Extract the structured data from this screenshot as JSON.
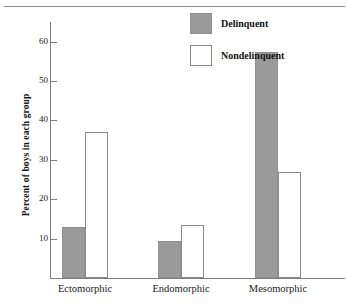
{
  "chart_data": {
    "type": "bar",
    "title": "",
    "xlabel": "",
    "ylabel": "Percent of boys in each group",
    "categories": [
      "Ectomorphic",
      "Endomorphic",
      "Mesomorphic"
    ],
    "series": [
      {
        "name": "Delinquent",
        "color": "#9a9a9a",
        "values": [
          13,
          9.5,
          57.5
        ]
      },
      {
        "name": "Nondelinquent",
        "color": "#ffffff",
        "values": [
          37,
          13.5,
          27
        ]
      }
    ],
    "ylim": [
      0,
      65
    ],
    "yticks": [
      10,
      20,
      30,
      40,
      50,
      60
    ],
    "ytick_labels": [
      "10",
      "20",
      "30",
      "40",
      "50",
      "60"
    ],
    "grid": false,
    "legend_position": "top-center-right"
  },
  "axis": {
    "y_title": "Percent of boys in each group",
    "tick_labels": [
      "60",
      "50",
      "40",
      "30",
      "20",
      "10"
    ]
  },
  "categories": [
    {
      "label": "Ectomorphic"
    },
    {
      "label": "Endomorphic"
    },
    {
      "label": "Mesomorphic"
    }
  ],
  "legend": {
    "items": [
      {
        "label": "Delinquent",
        "swatch": "filled-gray-square"
      },
      {
        "label": "Nondelinquent",
        "swatch": "outlined-white-square"
      }
    ]
  },
  "colors": {
    "delinquent_fill": "#9a9a9a",
    "nondelinquent_fill": "#ffffff",
    "axis_line": "#7d7d7d",
    "rule": "#8c8c8c",
    "text": "#1a1a1a"
  }
}
